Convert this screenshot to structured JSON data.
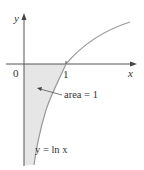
{
  "diagram": {
    "axes": {
      "x_label": "x",
      "y_label": "y",
      "origin_label": "0",
      "tick_label": "1"
    },
    "curve": {
      "label": "y = ln x",
      "color": "#9a9a9a"
    },
    "shaded_region": {
      "label": "area = 1",
      "fill": "#e6e6e6"
    }
  }
}
